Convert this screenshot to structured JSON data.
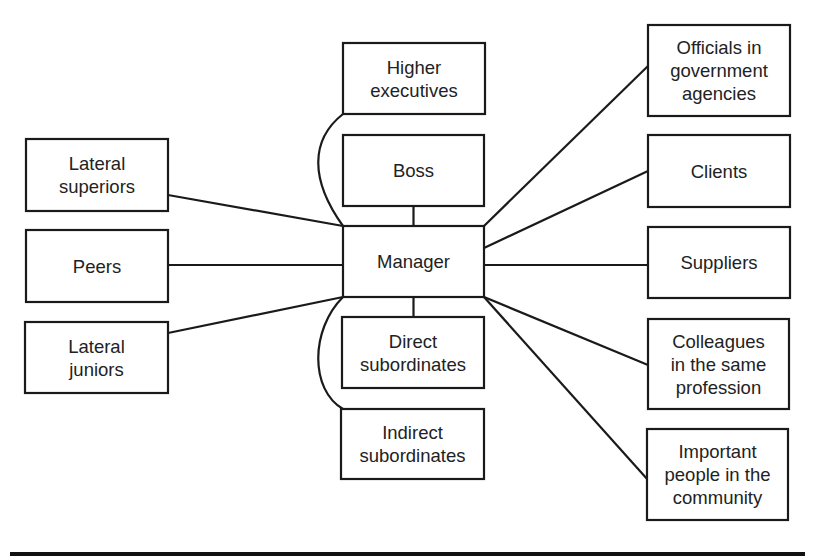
{
  "diagram": {
    "center": {
      "id": "manager",
      "lines": [
        "Manager"
      ]
    },
    "nodes": [
      {
        "id": "higher-executives",
        "lines": [
          "Higher",
          "executives"
        ],
        "group": "vertical"
      },
      {
        "id": "boss",
        "lines": [
          "Boss"
        ],
        "group": "vertical"
      },
      {
        "id": "direct-subordinates",
        "lines": [
          "Direct",
          "subordinates"
        ],
        "group": "vertical"
      },
      {
        "id": "indirect-subordinates",
        "lines": [
          "Indirect",
          "subordinates"
        ],
        "group": "vertical"
      },
      {
        "id": "lateral-superiors",
        "lines": [
          "Lateral",
          "superiors"
        ],
        "group": "lateral"
      },
      {
        "id": "peers",
        "lines": [
          "Peers"
        ],
        "group": "lateral"
      },
      {
        "id": "lateral-juniors",
        "lines": [
          "Lateral",
          "juniors"
        ],
        "group": "lateral"
      },
      {
        "id": "officials",
        "lines": [
          "Officials in",
          "government",
          "agencies"
        ],
        "group": "external"
      },
      {
        "id": "clients",
        "lines": [
          "Clients"
        ],
        "group": "external"
      },
      {
        "id": "suppliers",
        "lines": [
          "Suppliers"
        ],
        "group": "external"
      },
      {
        "id": "colleagues",
        "lines": [
          "Colleagues",
          "in the same",
          "profession"
        ],
        "group": "external"
      },
      {
        "id": "important-people",
        "lines": [
          "Important",
          "people in the",
          "community"
        ],
        "group": "external"
      }
    ],
    "edges": [
      {
        "from": "manager",
        "to": "boss",
        "style": "straight"
      },
      {
        "from": "manager",
        "to": "direct-subordinates",
        "style": "straight"
      },
      {
        "from": "manager",
        "to": "higher-executives",
        "style": "curved"
      },
      {
        "from": "manager",
        "to": "indirect-subordinates",
        "style": "curved"
      },
      {
        "from": "manager",
        "to": "lateral-superiors",
        "style": "straight"
      },
      {
        "from": "manager",
        "to": "peers",
        "style": "straight"
      },
      {
        "from": "manager",
        "to": "lateral-juniors",
        "style": "straight"
      },
      {
        "from": "manager",
        "to": "officials",
        "style": "straight"
      },
      {
        "from": "manager",
        "to": "clients",
        "style": "straight"
      },
      {
        "from": "manager",
        "to": "suppliers",
        "style": "straight"
      },
      {
        "from": "manager",
        "to": "colleagues",
        "style": "straight"
      },
      {
        "from": "manager",
        "to": "important-people",
        "style": "straight"
      }
    ],
    "colors": {
      "stroke": "#1a1a1a",
      "text": "#222222",
      "background": "#ffffff"
    }
  }
}
